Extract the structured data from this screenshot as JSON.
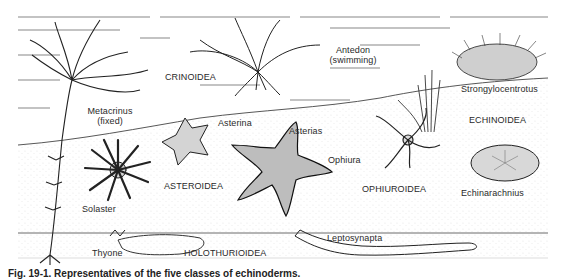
{
  "figure": {
    "classes": [
      {
        "name": "CRINOIDEA",
        "examples": [
          "Metacrinus (fixed)",
          "Antedon (swimming)"
        ]
      },
      {
        "name": "ECHINOIDEA",
        "examples": [
          "Strongylocentrotus",
          "Echinarachnius"
        ]
      },
      {
        "name": "ASTEROIDEA",
        "examples": [
          "Solaster",
          "Asterina",
          "Asterias"
        ]
      },
      {
        "name": "OPHIUROIDEA",
        "examples": [
          "Ophiura"
        ]
      },
      {
        "name": "HOLOTHURIOIDEA",
        "examples": [
          "Thyone",
          "Leptosynapta"
        ]
      }
    ],
    "labels": {
      "metacrinus": "Metacrinus",
      "metacrinus_note": "(fixed)",
      "crinoidea": "CRINOIDEA",
      "antedon": "Antedon",
      "antedon_note": "(swimming)",
      "strongylocentrotus": "Strongylocentrotus",
      "echinoidea": "ECHINOIDEA",
      "asterina": "Asterina",
      "asterias": "Asterias",
      "ophiura": "Ophiura",
      "solaster": "Solaster",
      "asteroidea": "ASTEROIDEA",
      "ophiuroidea": "OPHIUROIDEA",
      "echinarachnius": "Echinarachnius",
      "thyone": "Thyone",
      "holothurioidea": "HOLOTHURIOIDEA",
      "leptosynapta": "Leptosynapta"
    },
    "caption": "Fig. 19-1. Representatives of the five classes of echinoderms."
  }
}
